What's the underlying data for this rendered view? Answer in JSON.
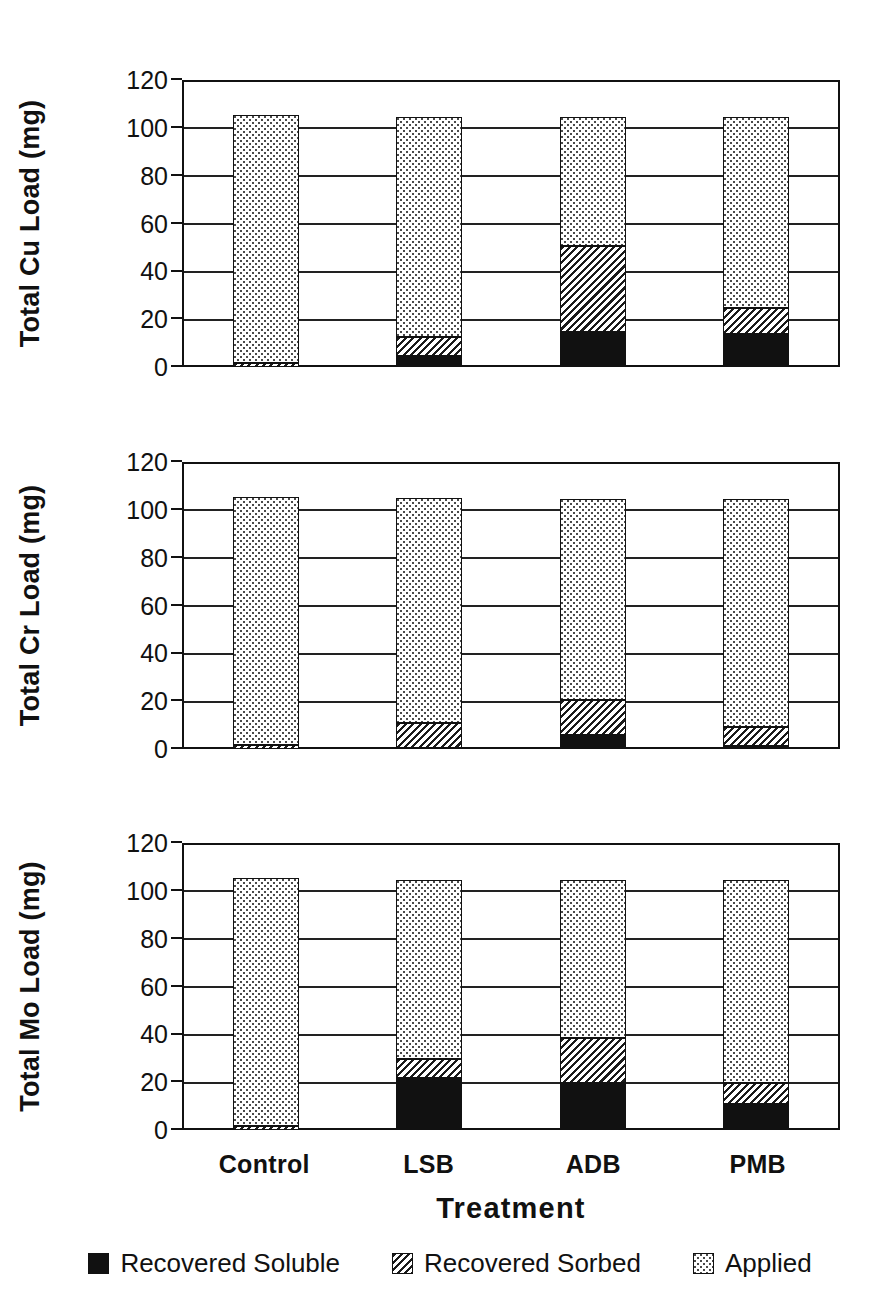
{
  "figure": {
    "xaxis_title": "Treatment",
    "categories": [
      "Control",
      "LSB",
      "ADB",
      "PMB"
    ],
    "y_ticks": [
      "0",
      "20",
      "40",
      "60",
      "80",
      "100",
      "120"
    ],
    "legend": [
      {
        "label": "Recovered Soluble",
        "pattern": "solid-black",
        "color": "#111111"
      },
      {
        "label": "Recovered Sorbed",
        "pattern": "diagonal-hatch",
        "color": "#1a1a1a"
      },
      {
        "label": "Applied",
        "pattern": "fine-dots",
        "color": "#4a4a4a"
      }
    ]
  },
  "chart_data": [
    {
      "type": "bar",
      "stacked": true,
      "title": "",
      "xlabel": "Treatment",
      "ylabel": "Total Cu Load (mg)",
      "ylim": [
        0,
        120
      ],
      "yticks": [
        0,
        20,
        40,
        60,
        80,
        100,
        120
      ],
      "grid": true,
      "legend_position": "below-figure",
      "categories": [
        "Control",
        "LSB",
        "ADB",
        "PMB"
      ],
      "series": [
        {
          "name": "Recovered Soluble",
          "values": [
            0,
            5,
            15,
            14
          ]
        },
        {
          "name": "Recovered Sorbed",
          "values": [
            1.5,
            8,
            36,
            11
          ]
        },
        {
          "name": "Applied",
          "values": [
            103.5,
            92,
            54,
            80
          ]
        }
      ],
      "totals": [
        105,
        105,
        105,
        105
      ]
    },
    {
      "type": "bar",
      "stacked": true,
      "title": "",
      "xlabel": "Treatment",
      "ylabel": "Total Cr Load (mg)",
      "ylim": [
        0,
        120
      ],
      "yticks": [
        0,
        20,
        40,
        60,
        80,
        100,
        120
      ],
      "grid": true,
      "legend_position": "below-figure",
      "categories": [
        "Control",
        "LSB",
        "ADB",
        "PMB"
      ],
      "series": [
        {
          "name": "Recovered Soluble",
          "values": [
            0,
            0.5,
            6,
            1.5
          ]
        },
        {
          "name": "Recovered Sorbed",
          "values": [
            1.5,
            10.5,
            15,
            8
          ]
        },
        {
          "name": "Applied",
          "values": [
            103.5,
            94,
            84,
            95.5
          ]
        }
      ],
      "totals": [
        105,
        105,
        105,
        105
      ]
    },
    {
      "type": "bar",
      "stacked": true,
      "title": "",
      "xlabel": "Treatment",
      "ylabel": "Total Mo Load (mg)",
      "ylim": [
        0,
        120
      ],
      "yticks": [
        0,
        20,
        40,
        60,
        80,
        100,
        120
      ],
      "grid": true,
      "legend_position": "below-figure",
      "categories": [
        "Control",
        "LSB",
        "ADB",
        "PMB"
      ],
      "series": [
        {
          "name": "Recovered Soluble",
          "values": [
            0,
            22,
            20,
            11
          ]
        },
        {
          "name": "Recovered Sorbed",
          "values": [
            1.5,
            8,
            19,
            9
          ]
        },
        {
          "name": "Applied",
          "values": [
            103.5,
            75,
            66,
            85
          ]
        }
      ],
      "totals": [
        105,
        105,
        105,
        105
      ]
    }
  ]
}
